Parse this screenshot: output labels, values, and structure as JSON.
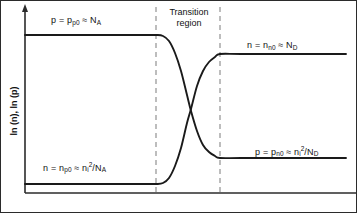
{
  "figure": {
    "type": "semiconductor-carrier-concentration-diagram",
    "axis_color": "#2b2b2b",
    "curve_color": "#1a1a1a",
    "dashed_color": "#9a9a9a",
    "background": "#ffffff"
  },
  "axes": {
    "y_title_parts": {
      "full": "ln (n), ln (p)",
      "first": "ln (n), ln (p)"
    },
    "y_arrow": true,
    "x_baseline": true,
    "x_title": "",
    "ticks": []
  },
  "regions": {
    "transition": {
      "line1": "Transition",
      "line2": "region",
      "left_boundary_x": 155,
      "right_boundary_x": 219
    }
  },
  "labels": {
    "p_left": {
      "lhs": "p = p",
      "lhs_sub": "p0",
      "approx": " ≈ N",
      "approx_sub": "A"
    },
    "n_right": {
      "lhs": "n = n",
      "lhs_sub": "n0",
      "approx": " ≈ N",
      "approx_sub": "D"
    },
    "n_left": {
      "lhs": "n = n",
      "lhs_sub": "p0",
      "approx": " ≈ n",
      "approx_sub": "i",
      "approx_sup": "2",
      "tail": "/N",
      "tail_sub": "A"
    },
    "p_right": {
      "lhs": "p = p",
      "lhs_sub": "n0",
      "approx": " ≈ n",
      "approx_sub": "i",
      "approx_sup": "2",
      "tail": "/N",
      "tail_sub": "D"
    }
  },
  "chart_data": {
    "type": "line",
    "title": "",
    "xlabel": "",
    "ylabel": "ln (n), ln (p)",
    "grid": false,
    "legend": "none",
    "xlim": [
      24,
      345
    ],
    "ylim": [
      192,
      5
    ],
    "annotations": [
      "p = p_p0 ≈ N_A",
      "n = n_n0 ≈ N_D",
      "n = n_p0 ≈ n_i^2/N_A",
      "p = p_n0 ≈ n_i^2/N_D",
      "Transition region"
    ],
    "vertical_dashed_lines_x": [
      155,
      219
    ],
    "series": [
      {
        "name": "p (hole concentration)",
        "description": "High on p-side, drops through transition region to low level on n-side",
        "left_plateau_y": 34,
        "right_plateau_y": 157,
        "points": [
          [
            24,
            34
          ],
          [
            60,
            34
          ],
          [
            100,
            34
          ],
          [
            140,
            34
          ],
          [
            155,
            34
          ],
          [
            162,
            35
          ],
          [
            168,
            40
          ],
          [
            174,
            52
          ],
          [
            180,
            70
          ],
          [
            186,
            94
          ],
          [
            190,
            110
          ],
          [
            196,
            130
          ],
          [
            202,
            144
          ],
          [
            208,
            151
          ],
          [
            214,
            155
          ],
          [
            219,
            157
          ],
          [
            240,
            157
          ],
          [
            290,
            157
          ],
          [
            345,
            157
          ]
        ]
      },
      {
        "name": "n (electron concentration)",
        "description": "Low on p-side, rises through transition region to high level on n-side",
        "left_plateau_y": 183,
        "right_plateau_y": 53,
        "points": [
          [
            24,
            183
          ],
          [
            60,
            183
          ],
          [
            100,
            183
          ],
          [
            140,
            183
          ],
          [
            155,
            183
          ],
          [
            162,
            182
          ],
          [
            168,
            177
          ],
          [
            174,
            165
          ],
          [
            180,
            147
          ],
          [
            186,
            122
          ],
          [
            190,
            108
          ],
          [
            196,
            85
          ],
          [
            202,
            70
          ],
          [
            208,
            61
          ],
          [
            214,
            56
          ],
          [
            219,
            53
          ],
          [
            240,
            53
          ],
          [
            290,
            53
          ],
          [
            345,
            53
          ]
        ]
      }
    ]
  }
}
